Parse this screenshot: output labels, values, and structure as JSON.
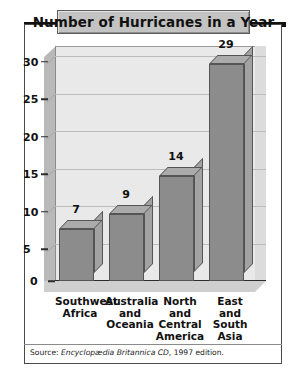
{
  "title": "Number of Hurricanes in a Year",
  "source": {
    "prefix": "Source: ",
    "work": "Encyclopædia Britannica CD",
    "suffix": ", 1997 edition."
  },
  "colors": {
    "bar_front": "#8c8c8c",
    "bar_top": "#ababab",
    "bar_side": "#a2a2a2",
    "plot_background": "#e9e9e9",
    "banner": "#c3c3c3",
    "frame": "#4a4a4a"
  },
  "chart_data": {
    "type": "bar",
    "title": "Number of Hurricanes in a Year",
    "categories": [
      "Southwest\nAfrica",
      "Australia\nand\nOceania",
      "North and\nCentral\nAmerica",
      "East and\nSouth Asia"
    ],
    "values": [
      7,
      9,
      14,
      29
    ],
    "value_labels": [
      "7",
      "9",
      "14",
      "29"
    ],
    "xlabel": "",
    "ylabel": "",
    "ylim": [
      0,
      30
    ],
    "yticks": [
      0,
      5,
      10,
      15,
      20,
      25,
      30
    ],
    "ytick_labels": [
      "0",
      "5",
      "10",
      "15",
      "20",
      "25",
      "30"
    ],
    "grid": true,
    "legend": false,
    "style": "3d-column"
  }
}
